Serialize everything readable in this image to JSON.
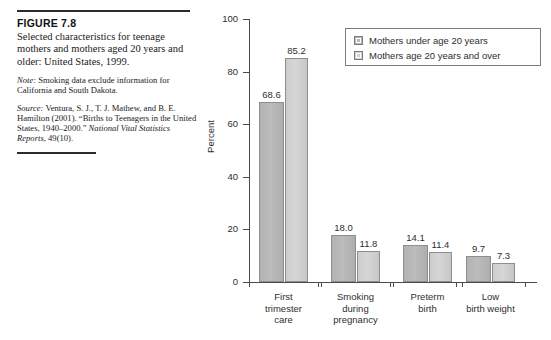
{
  "figure": {
    "number": "FIGURE 7.8",
    "title": "Selected characteristics for teenage mothers and mothers aged 20 years and older: United States, 1999.",
    "note_lead": "Note:",
    "note_text": " Smoking data exclude information for California and South Dakota.",
    "source_lead": "Source:",
    "source_text_1": " Ventura, S. J., T. J. Mathew, and B. E. Hamilton (2001). “Births to Teenagers in the United States, 1940–2000.” ",
    "source_italic": "National Vital Statistics Reports",
    "source_text_2": ", 49(10)."
  },
  "chart_data": {
    "type": "bar",
    "title": "",
    "xlabel": "",
    "ylabel": "Percent",
    "ylim": [
      0,
      100
    ],
    "yticks": [
      0,
      20,
      40,
      60,
      80,
      100
    ],
    "ytick_labels": [
      "0",
      "20",
      "40",
      "60",
      "80",
      "100"
    ],
    "grid": false,
    "legend_position": "top-right",
    "categories": [
      "First\ntrimester\ncare",
      "Smoking\nduring\npregnancy",
      "Preterm\nbirth",
      "Low\nbirth weight"
    ],
    "series": [
      {
        "name": "Mothers under age 20 years",
        "color": "#b6b6b6",
        "values": [
          68.6,
          18.0,
          14.1,
          9.7
        ],
        "labels": [
          "68.6",
          "18.0",
          "14.1",
          "9.7"
        ]
      },
      {
        "name": "Mothers age 20 years and over",
        "color": "#d2d2d2",
        "values": [
          85.2,
          11.8,
          11.4,
          7.3
        ],
        "labels": [
          "85.2",
          "11.8",
          "11.4",
          "7.3"
        ]
      }
    ]
  }
}
